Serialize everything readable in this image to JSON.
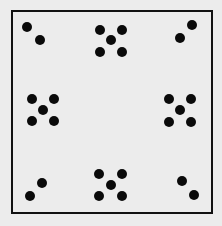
{
  "diagram": {
    "background": "#ececec",
    "frame": {
      "x": 12,
      "y": 11,
      "width": 200,
      "height": 202,
      "stroke": "#111111",
      "stroke_width": 2
    },
    "dot_color": "#0a0a0a",
    "dot_radius": 5,
    "clusters": [
      {
        "position": "top-left",
        "count": 2,
        "dots": [
          [
            27,
            27
          ],
          [
            40,
            40
          ]
        ]
      },
      {
        "position": "top-center",
        "count": 5,
        "dots": [
          [
            100,
            30
          ],
          [
            122,
            30
          ],
          [
            111,
            40
          ],
          [
            100,
            52
          ],
          [
            122,
            52
          ]
        ]
      },
      {
        "position": "top-right",
        "count": 2,
        "dots": [
          [
            192,
            25
          ],
          [
            180,
            38
          ]
        ]
      },
      {
        "position": "middle-left",
        "count": 5,
        "dots": [
          [
            32,
            99
          ],
          [
            54,
            99
          ],
          [
            43,
            110
          ],
          [
            32,
            121
          ],
          [
            54,
            121
          ]
        ]
      },
      {
        "position": "middle-right",
        "count": 5,
        "dots": [
          [
            169,
            99
          ],
          [
            191,
            99
          ],
          [
            180,
            110
          ],
          [
            169,
            122
          ],
          [
            191,
            122
          ]
        ]
      },
      {
        "position": "bottom-left",
        "count": 2,
        "dots": [
          [
            42,
            183
          ],
          [
            30,
            196
          ]
        ]
      },
      {
        "position": "bottom-center",
        "count": 5,
        "dots": [
          [
            99,
            174
          ],
          [
            122,
            174
          ],
          [
            111,
            185
          ],
          [
            99,
            196
          ],
          [
            122,
            196
          ]
        ]
      },
      {
        "position": "bottom-right",
        "count": 2,
        "dots": [
          [
            182,
            181
          ],
          [
            194,
            195
          ]
        ]
      }
    ]
  }
}
